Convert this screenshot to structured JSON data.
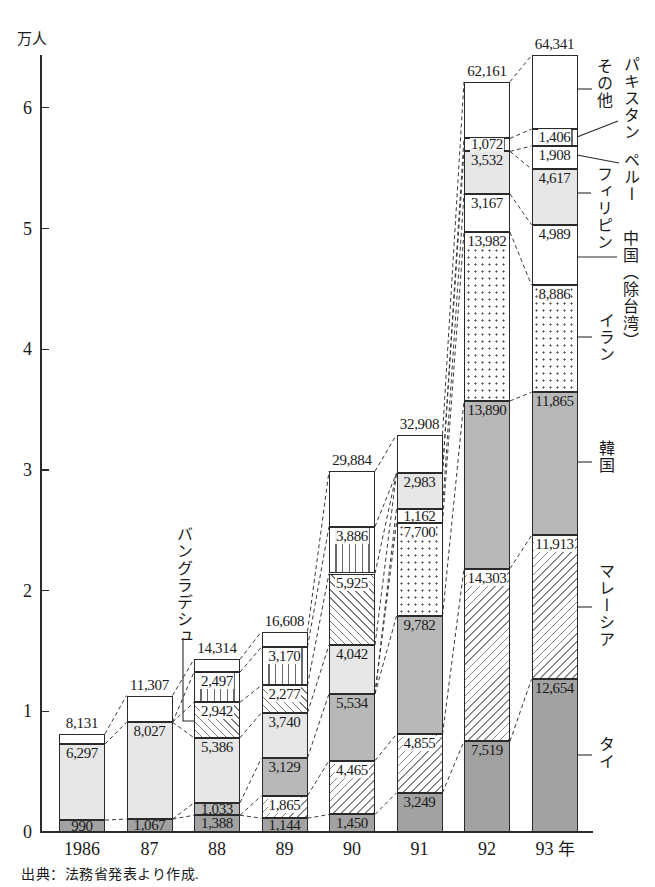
{
  "axis": {
    "unit": "万人",
    "tick_labels": [
      "0",
      "1",
      "2",
      "3",
      "4",
      "5",
      "6"
    ]
  },
  "source": "出典：法務省発表より作成.",
  "legend": {
    "other": "その他",
    "pakistan": "パキスタン",
    "peru": "ペルー",
    "philippines": "フィリピン",
    "china": "中国（除台湾）",
    "iran": "イラン",
    "korea": "韓国",
    "malaysia": "マレーシア",
    "thai": "タイ",
    "bangladesh": "バングラデシュ"
  },
  "chart_data": {
    "type": "bar",
    "stacked": true,
    "title": "",
    "xlabel": "",
    "ylabel": "万人",
    "x_unit": "年",
    "categories": [
      "1986",
      "87",
      "88",
      "89",
      "90",
      "91",
      "92",
      "93"
    ],
    "yticks": [
      0,
      1,
      2,
      3,
      4,
      5,
      6
    ],
    "ylim": [
      0,
      6.5
    ],
    "grid": false,
    "legend_position": "right (direct labels with leader lines)",
    "totals": [
      8131,
      11307,
      14314,
      16608,
      29884,
      32908,
      62161,
      64341
    ],
    "series": [
      {
        "key": "thai",
        "name": "タイ",
        "labeled": true,
        "values": [
          990,
          1067,
          1388,
          1144,
          1450,
          3249,
          7519,
          12654
        ]
      },
      {
        "key": "malaysia",
        "name": "マレーシア",
        "labeled": true,
        "values": [
          0,
          0,
          0,
          1865,
          4465,
          4855,
          14303,
          11913
        ]
      },
      {
        "key": "korea",
        "name": "韓国",
        "labeled": true,
        "values": [
          0,
          0,
          1033,
          3129,
          5534,
          9782,
          13890,
          11865
        ]
      },
      {
        "key": "iran",
        "name": "イラン",
        "labeled": true,
        "values": [
          0,
          0,
          0,
          0,
          0,
          7700,
          13982,
          8886
        ]
      },
      {
        "key": "china",
        "name": "中国（除台湾）",
        "labeled": true,
        "values": [
          0,
          0,
          0,
          0,
          0,
          1162,
          3167,
          4989
        ]
      },
      {
        "key": "philippines",
        "name": "フィリピン",
        "labeled": true,
        "values": [
          6297,
          8027,
          5386,
          3740,
          4042,
          2983,
          3532,
          4617
        ]
      },
      {
        "key": "peru",
        "name": "ペルー",
        "labeled": true,
        "values": [
          0,
          0,
          0,
          0,
          0,
          0,
          0,
          1908
        ]
      },
      {
        "key": "bangladesh",
        "name": "バングラデシュ",
        "labeled": true,
        "values": [
          0,
          0,
          2942,
          2277,
          5925,
          0,
          0,
          0
        ]
      },
      {
        "key": "pakistan",
        "name": "パキスタン",
        "labeled": true,
        "values": [
          0,
          0,
          2497,
          3170,
          3886,
          0,
          1072,
          1406
        ]
      },
      {
        "key": "other",
        "name": "その他",
        "labeled": false,
        "values": [
          844,
          2213,
          1068,
          1283,
          4582,
          3177,
          4696,
          6103
        ]
      }
    ]
  }
}
